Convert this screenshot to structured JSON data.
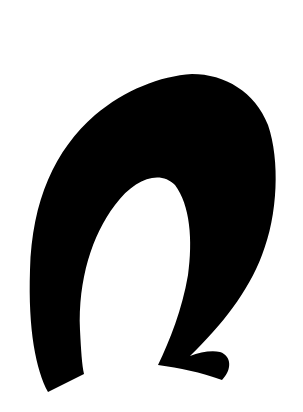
{
  "image": {
    "background_color": "#ffffff",
    "glyph_color": "#000000",
    "glyph_description": "stylized-omega-glyph"
  }
}
